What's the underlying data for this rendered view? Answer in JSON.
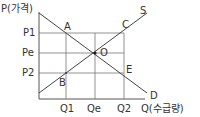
{
  "diagram": {
    "type": "supply-demand",
    "axes": {
      "y_label": "P(가격)",
      "x_label": "Q(수급량)"
    },
    "price_ticks": [
      "P1",
      "Pe",
      "P2"
    ],
    "quantity_ticks": [
      "Q1",
      "Qe",
      "Q2"
    ],
    "curves": {
      "supply": "S",
      "demand": "D"
    },
    "points": {
      "A": "A",
      "B": "B",
      "C": "C",
      "E": "E",
      "O": "O"
    },
    "colors": {
      "line": "#444444",
      "grid": "#666666"
    }
  }
}
